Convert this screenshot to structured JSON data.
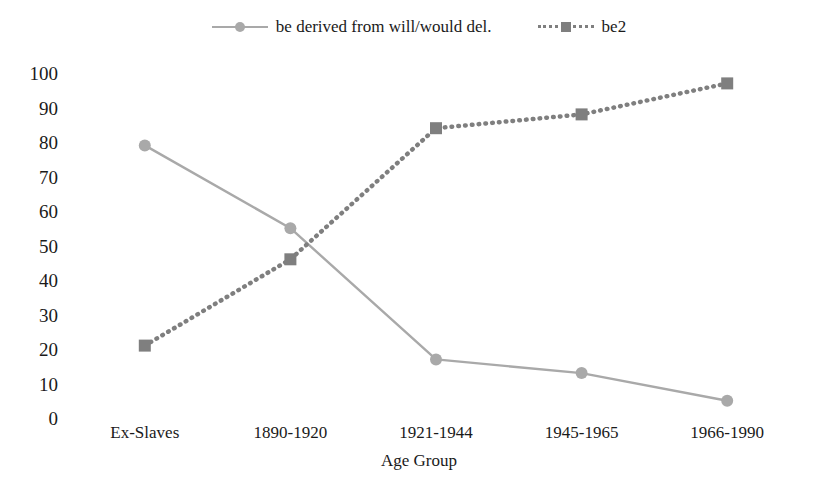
{
  "legend": {
    "position": "top-center",
    "entries": [
      {
        "label": "be derived from will/would del.",
        "marker": "circle",
        "line": "solid",
        "color": "#a9a9a9"
      },
      {
        "label": "be2",
        "marker": "square",
        "line": "dotted",
        "color": "#7f7f7f"
      }
    ]
  },
  "axes": {
    "y_ticks": [
      "0",
      "10",
      "20",
      "30",
      "40",
      "50",
      "60",
      "70",
      "80",
      "90",
      "100"
    ],
    "x_title": "Age Group"
  },
  "caption": {
    "text": ""
  },
  "chart_data": {
    "type": "line",
    "title": "",
    "subtitle": "",
    "xlabel": "Age Group",
    "ylabel": "",
    "categories": [
      "Ex-Slaves",
      "1890-1920",
      "1921-1944",
      "1945-1965",
      "1966-1990"
    ],
    "series": [
      {
        "name": "be derived from will/would del.",
        "values": [
          79,
          55,
          17,
          13,
          5
        ],
        "marker": "circle",
        "linestyle": "solid",
        "color": "#a9a9a9"
      },
      {
        "name": "be2",
        "values": [
          21,
          46,
          84,
          88,
          97
        ],
        "marker": "square",
        "linestyle": "dotted",
        "color": "#7f7f7f"
      }
    ],
    "ylim": [
      0,
      100
    ],
    "ytick_step": 10,
    "grid": false,
    "legend_position": "top-center"
  }
}
